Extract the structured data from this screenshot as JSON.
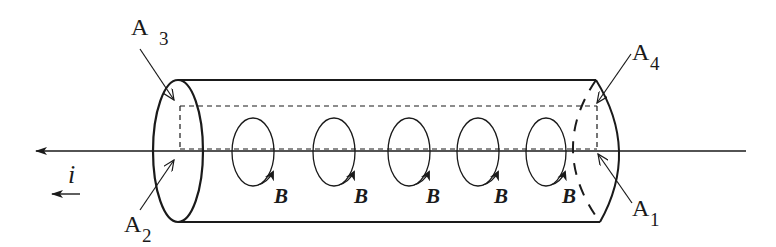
{
  "diagram": {
    "type": "physics-figure",
    "labels": {
      "a3": {
        "letter": "A",
        "sub": "3"
      },
      "a4": {
        "letter": "A",
        "sub": "4"
      },
      "a2": {
        "letter": "A",
        "sub": "2"
      },
      "a1": {
        "letter": "A",
        "sub": "1"
      },
      "current": "i",
      "field": "B"
    },
    "field_loops": [
      {
        "label": "B"
      },
      {
        "label": "B"
      },
      {
        "label": "B"
      },
      {
        "label": "B"
      },
      {
        "label": "B"
      }
    ],
    "colors": {
      "stroke": "#1a1a1a",
      "background": "#ffffff"
    }
  }
}
